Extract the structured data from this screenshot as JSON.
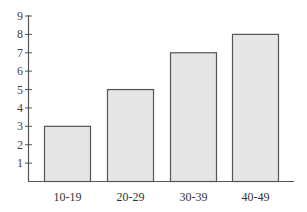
{
  "chart_data": {
    "type": "bar",
    "title": "",
    "xlabel": "",
    "ylabel": "",
    "categories": [
      "10-19",
      "20-29",
      "30-39",
      "40-49"
    ],
    "values": [
      3,
      5,
      7,
      8
    ],
    "ylim": [
      0,
      9
    ],
    "yticks": [
      1,
      2,
      3,
      4,
      5,
      6,
      7,
      8,
      9
    ],
    "grid": false,
    "legend": null,
    "colors": {
      "bar_fill": "#e6e6e6",
      "bar_stroke": "#555555",
      "axis": "#555555"
    }
  }
}
